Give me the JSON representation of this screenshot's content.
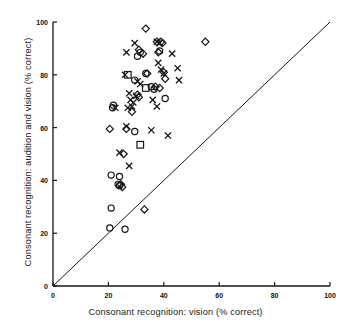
{
  "figure": {
    "background_color": "#ffffff",
    "ink_color": "#161616"
  },
  "axes": {
    "x_label": "Consonant recognition: vision (% correct)",
    "y_label": "Consonant recognition: audition and vision (% correct)",
    "x_ticks": [
      "0",
      "20",
      "40",
      "60",
      "80",
      "100"
    ],
    "y_ticks": [
      "0",
      "20",
      "40",
      "60",
      "80",
      "100"
    ]
  },
  "chart_data": {
    "type": "scatter",
    "title": "",
    "xlabel": "Consonant recognition: vision (% correct)",
    "ylabel": "Consonant recognition: audition and vision (% correct)",
    "xlim": [
      0,
      100
    ],
    "ylim": [
      0,
      100
    ],
    "xticks": [
      0,
      20,
      40,
      60,
      80,
      100
    ],
    "yticks": [
      0,
      20,
      40,
      60,
      80,
      100
    ],
    "grid": false,
    "legend": "none",
    "reference_line": {
      "name": "identity-line",
      "description": "y = x diagonal line",
      "from": [
        0,
        0
      ],
      "to": [
        100,
        100
      ]
    },
    "series": [
      {
        "name": "cross",
        "marker": "x",
        "points": [
          [
            26.5,
            88.5
          ],
          [
            29.5,
            92.0
          ],
          [
            37.5,
            92.5
          ],
          [
            38.5,
            92.0
          ],
          [
            43.0,
            88.0
          ],
          [
            45.0,
            82.5
          ],
          [
            38.0,
            84.5
          ],
          [
            39.0,
            82.0
          ],
          [
            40.0,
            80.5
          ],
          [
            45.5,
            78.0
          ],
          [
            26.0,
            80.0
          ],
          [
            30.5,
            77.5
          ],
          [
            31.5,
            76.5
          ],
          [
            27.5,
            73.0
          ],
          [
            30.0,
            72.0
          ],
          [
            28.0,
            70.5
          ],
          [
            29.0,
            69.5
          ],
          [
            28.5,
            68.0
          ],
          [
            27.0,
            67.5
          ],
          [
            36.0,
            70.5
          ],
          [
            37.5,
            68.0
          ],
          [
            26.5,
            60.5
          ],
          [
            35.5,
            59.0
          ],
          [
            41.5,
            57.0
          ],
          [
            24.0,
            50.5
          ],
          [
            27.5,
            45.5
          ],
          [
            22.5,
            67.5
          ]
        ]
      },
      {
        "name": "circle",
        "marker": "o",
        "points": [
          [
            31.5,
            88.5
          ],
          [
            30.5,
            87.0
          ],
          [
            33.5,
            80.5
          ],
          [
            29.5,
            78.0
          ],
          [
            21.5,
            67.5
          ],
          [
            21.8,
            68.5
          ],
          [
            35.5,
            75.5
          ],
          [
            36.5,
            74.5
          ],
          [
            40.5,
            71.0
          ],
          [
            29.5,
            58.5
          ],
          [
            21.0,
            42.0
          ],
          [
            24.0,
            41.5
          ],
          [
            23.5,
            38.5
          ],
          [
            24.0,
            38.0
          ],
          [
            21.0,
            29.5
          ],
          [
            20.5,
            22.0
          ],
          [
            26.0,
            21.5
          ],
          [
            38.5,
            89.0
          ]
        ]
      },
      {
        "name": "diamond",
        "marker": "d",
        "points": [
          [
            33.5,
            97.5
          ],
          [
            37.5,
            92.5
          ],
          [
            39.0,
            92.5
          ],
          [
            55.0,
            92.5
          ],
          [
            31.0,
            89.5
          ],
          [
            32.5,
            88.0
          ],
          [
            38.0,
            88.5
          ],
          [
            34.0,
            80.5
          ],
          [
            37.0,
            75.5
          ],
          [
            38.5,
            75.0
          ],
          [
            30.5,
            72.5
          ],
          [
            31.0,
            71.5
          ],
          [
            28.5,
            66.0
          ],
          [
            20.5,
            59.5
          ],
          [
            26.5,
            59.5
          ],
          [
            25.5,
            50.0
          ],
          [
            24.5,
            38.5
          ],
          [
            25.0,
            37.5
          ],
          [
            33.0,
            29.0
          ],
          [
            39.5,
            92.0
          ],
          [
            40.0,
            81.0
          ],
          [
            40.5,
            78.5
          ]
        ]
      },
      {
        "name": "square",
        "marker": "s",
        "points": [
          [
            27.0,
            80.0
          ],
          [
            33.5,
            75.0
          ],
          [
            31.5,
            53.5
          ]
        ]
      }
    ]
  }
}
